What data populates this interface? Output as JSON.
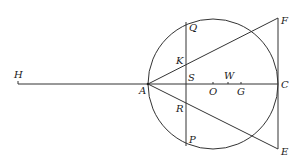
{
  "diagram": {
    "type": "geometry-construction",
    "stroke_color": "#333333",
    "background": "#ffffff",
    "points": {
      "H": {
        "label": "H",
        "x": 18,
        "y": 84
      },
      "A": {
        "label": "A",
        "x": 148,
        "y": 84
      },
      "S": {
        "label": "S",
        "x": 186,
        "y": 84
      },
      "O": {
        "label": "O",
        "x": 213,
        "y": 84
      },
      "W": {
        "label": "W",
        "x": 228,
        "y": 84
      },
      "G": {
        "label": "G",
        "x": 241,
        "y": 84
      },
      "C": {
        "label": "C",
        "x": 278,
        "y": 84
      },
      "Q": {
        "label": "Q",
        "x": 186,
        "y": 22
      },
      "K": {
        "label": "K",
        "x": 186,
        "y": 64
      },
      "R": {
        "label": "R",
        "x": 186,
        "y": 103
      },
      "P": {
        "label": "P",
        "x": 186,
        "y": 146
      },
      "F": {
        "label": "F",
        "x": 278,
        "y": 18
      },
      "E": {
        "label": "E",
        "x": 278,
        "y": 149
      }
    },
    "circle": {
      "center": "O",
      "cx": 213,
      "cy": 84,
      "r": 65
    },
    "segments": [
      [
        "H",
        "C"
      ],
      [
        "Q",
        "P"
      ],
      [
        "F",
        "E"
      ],
      [
        "A",
        "F"
      ],
      [
        "A",
        "E"
      ]
    ]
  }
}
